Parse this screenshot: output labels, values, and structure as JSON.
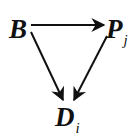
{
  "diagram": {
    "type": "commutative-diagram",
    "nodes": [
      {
        "id": "B",
        "label": "B",
        "subscript": ""
      },
      {
        "id": "P",
        "label": "P",
        "subscript": "j"
      },
      {
        "id": "D",
        "label": "D",
        "subscript": "i"
      }
    ],
    "edges": [
      {
        "from": "B",
        "to": "P",
        "direction": "horizontal"
      },
      {
        "from": "B",
        "to": "D",
        "direction": "diagonal-down-right"
      },
      {
        "from": "P",
        "to": "D",
        "direction": "diagonal-down-left"
      }
    ],
    "colors": {
      "ink": "#111111",
      "background": "#ffffff"
    }
  }
}
